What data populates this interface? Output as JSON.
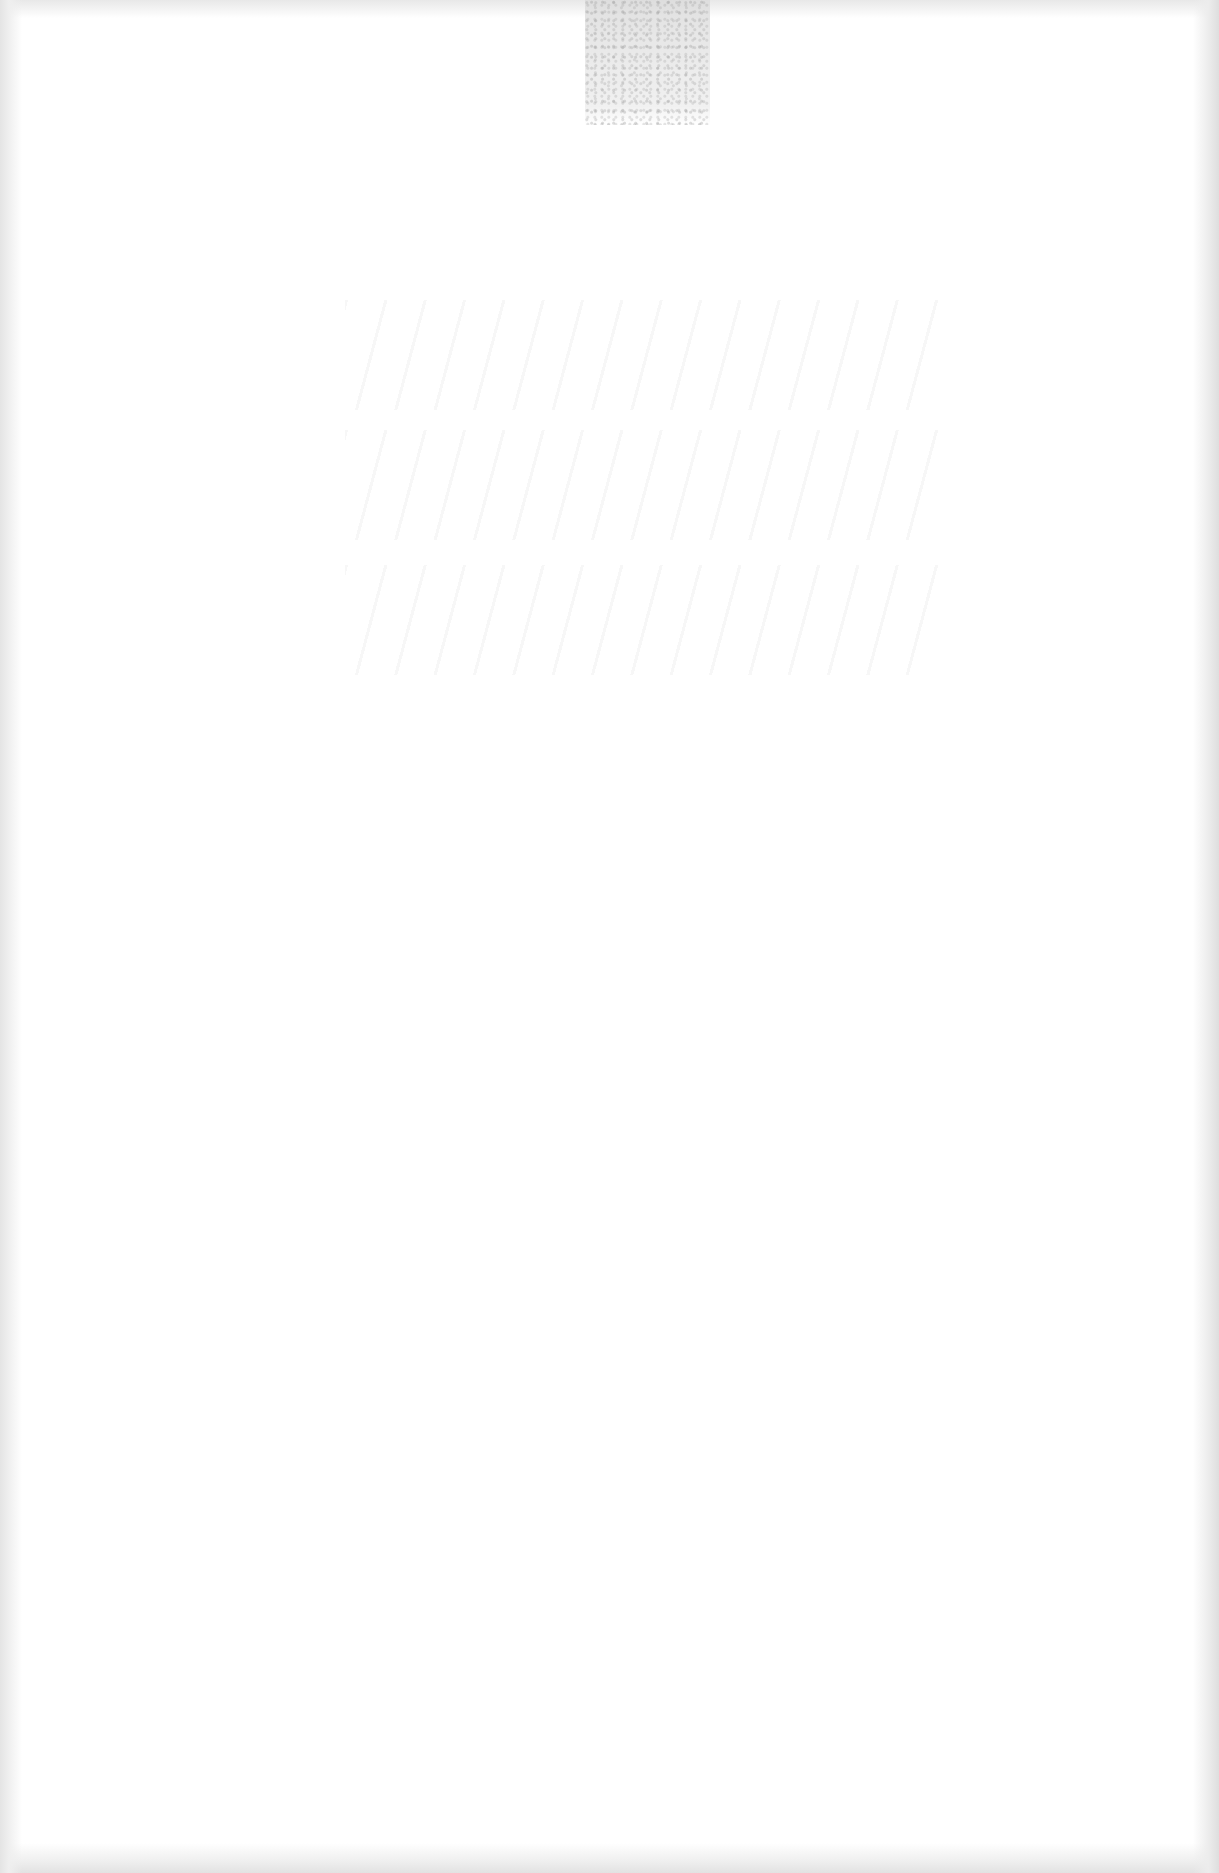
{
  "document": {
    "type": "scanned-page",
    "content": "",
    "visible_text": [],
    "background_color": "#ffffff",
    "artifacts": {
      "top_patch": {
        "description": "speckled gray scan artifact",
        "color": "#dcdcdc"
      },
      "show_through": {
        "description": "faint illegible bleed-through from reverse side",
        "legible": false
      },
      "edge_shadow_color": "#e2e2e2"
    }
  }
}
